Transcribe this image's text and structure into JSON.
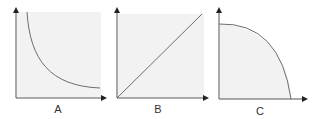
{
  "panels": [
    {
      "label": "A",
      "curve": "hyperbola-decreasing"
    },
    {
      "label": "B",
      "curve": "linear-increasing"
    },
    {
      "label": "C",
      "curve": "quarter-circle-concave"
    }
  ],
  "colors": {
    "axis": "#555555",
    "curve": "#6e6e6e",
    "fill": "#f2f2f2"
  }
}
